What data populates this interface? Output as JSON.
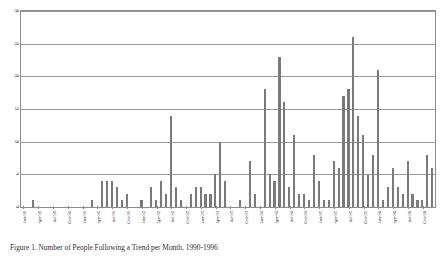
{
  "chart_data": {
    "type": "bar",
    "title": "",
    "subtitle": "",
    "xlabel": "",
    "ylabel": "",
    "ylim": [
      0,
      30
    ],
    "yticks": [
      0,
      5,
      10,
      15,
      20,
      25,
      30
    ],
    "grid": true,
    "legend": null,
    "bar_color": "#7a7a7a",
    "axis_color": "#8c8c8c",
    "gridline_color": "#9a9a9a",
    "categories": [
      "Jan-90",
      "Feb-90",
      "Mar-90",
      "Apr-90",
      "May-90",
      "Jun-90",
      "Jul-90",
      "Aug-90",
      "Sep-90",
      "Oct-90",
      "Nov-90",
      "Dec-90",
      "Jan-91",
      "Feb-91",
      "Mar-91",
      "Apr-91",
      "May-91",
      "Jun-91",
      "Jul-91",
      "Aug-91",
      "Sep-91",
      "Oct-91",
      "Nov-91",
      "Dec-91",
      "Jan-92",
      "Feb-92",
      "Mar-92",
      "Apr-92",
      "May-92",
      "Jun-92",
      "Jul-92",
      "Aug-92",
      "Sep-92",
      "Oct-92",
      "Nov-92",
      "Dec-92",
      "Jan-93",
      "Feb-93",
      "Mar-93",
      "Apr-93",
      "May-93",
      "Jun-93",
      "Jul-93",
      "Aug-93",
      "Sep-93",
      "Oct-93",
      "Nov-93",
      "Dec-93",
      "Jan-94",
      "Feb-94",
      "Mar-94",
      "Apr-94",
      "May-94",
      "Jun-94",
      "Jul-94",
      "Aug-94",
      "Sep-94",
      "Oct-94",
      "Nov-94",
      "Dec-94",
      "Jan-95",
      "Feb-95",
      "Mar-95",
      "Apr-95",
      "May-95",
      "Jun-95",
      "Jul-95",
      "Aug-95",
      "Sep-95",
      "Oct-95",
      "Nov-95",
      "Dec-95",
      "Jan-96",
      "Feb-96",
      "Mar-96",
      "Apr-96",
      "May-96",
      "Jun-96",
      "Jul-96",
      "Aug-96",
      "Sep-96",
      "Oct-96",
      "Nov-96",
      "Dec-96"
    ],
    "values": [
      0,
      0,
      1,
      0,
      0,
      0,
      0,
      0,
      0,
      0,
      0,
      0,
      0,
      0,
      1,
      0,
      4,
      4,
      4,
      3,
      1,
      2,
      0,
      0,
      1,
      0,
      3,
      1,
      4,
      2,
      14,
      3,
      1,
      0,
      2,
      3,
      3,
      2,
      2,
      5,
      10,
      4,
      0,
      0,
      1,
      0,
      7,
      2,
      0,
      18,
      5,
      4,
      23,
      16,
      3,
      11,
      2,
      2,
      1,
      8,
      4,
      1,
      1,
      7,
      6,
      17,
      18,
      26,
      14,
      11,
      5,
      8,
      21,
      1,
      3,
      6,
      3,
      2,
      7,
      2,
      1,
      1,
      8,
      6
    ],
    "xtick_labels": [
      "Jan-90",
      "Apr-90",
      "Jul-90",
      "Oct-90",
      "Jan-91",
      "Apr-91",
      "Jul-91",
      "Oct-91",
      "Jan-92",
      "Apr-92",
      "Jul-92",
      "Oct-92",
      "Jan-93",
      "Apr-93",
      "Jul-93",
      "Oct-93",
      "Jan-94",
      "Apr-94",
      "Jul-94",
      "Oct-94",
      "Jan-95",
      "Apr-95",
      "Jul-95",
      "Oct-95",
      "Jan-96",
      "Apr-96",
      "Jul-96",
      "Oct-96"
    ],
    "xtick_indices": [
      0,
      3,
      6,
      9,
      12,
      15,
      18,
      21,
      24,
      27,
      30,
      33,
      36,
      39,
      42,
      45,
      48,
      51,
      54,
      57,
      60,
      63,
      66,
      69,
      72,
      75,
      78,
      81
    ]
  },
  "caption": {
    "text": "Figure 1.  Number of People Following a Trend per Month, 1990-1996"
  }
}
